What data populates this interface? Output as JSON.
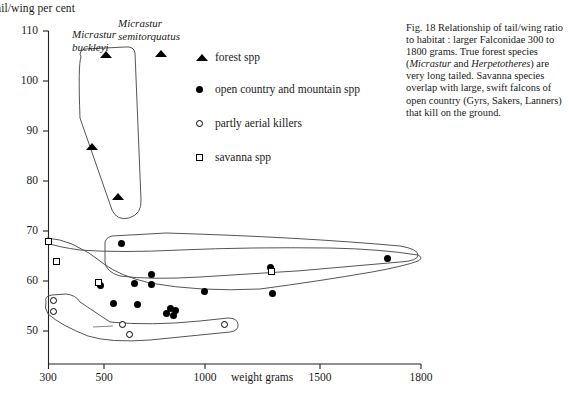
{
  "figure": {
    "caption_label": "Fig. 18",
    "caption_parts": [
      {
        "text": "Fig. 18 Relationship of tail/wing ratio to habitat : larger Falconidae 300 to 1800 grams. True forest species (",
        "style": "roman"
      },
      {
        "text": "Micrastur",
        "style": "italic"
      },
      {
        "text": " and ",
        "style": "roman"
      },
      {
        "text": "Herpetotheres",
        "style": "italic"
      },
      {
        "text": ") are very long tailed. Savanna species overlap with large, swift falcons of open country (Gyrs, Sakers, Lanners) that kill on the ground.",
        "style": "roman"
      }
    ]
  },
  "chart_data": {
    "type": "scatter",
    "title": "",
    "xlabel": "weight grams",
    "ylabel": "ail/wing per cent",
    "ylabel_full": "tail/wing per cent",
    "ylim": [
      46,
      110
    ],
    "yticks": [
      110,
      100,
      90,
      80,
      70,
      60,
      50
    ],
    "xticks": [
      300,
      500,
      1000,
      1500,
      1800
    ],
    "x_scale_note": "non-linear spacing: 300 and 500 compressed left, 500-1800 expanded",
    "grid": false,
    "legend_position": "upper-right-inside",
    "series": [
      {
        "name": "forest spp",
        "marker": "filled-triangle",
        "color": "#000000",
        "points": [
          {
            "x": 500,
            "y": 105.2
          },
          {
            "x": 660,
            "y": 105.4
          },
          {
            "x": 490,
            "y": 86.5
          },
          {
            "x": 560,
            "y": 76.5
          }
        ]
      },
      {
        "name": "open country and mountain spp",
        "marker": "filled-circle",
        "color": "#000000",
        "points": [
          {
            "x": 640,
            "y": 65.6
          },
          {
            "x": 575,
            "y": 57.2
          },
          {
            "x": 700,
            "y": 57.6
          },
          {
            "x": 760,
            "y": 59.3
          },
          {
            "x": 760,
            "y": 57.3
          },
          {
            "x": 625,
            "y": 53.7
          },
          {
            "x": 720,
            "y": 53.4
          },
          {
            "x": 800,
            "y": 51.8
          },
          {
            "x": 812,
            "y": 52.6
          },
          {
            "x": 820,
            "y": 51.2
          },
          {
            "x": 830,
            "y": 52.1
          },
          {
            "x": 950,
            "y": 56.4
          },
          {
            "x": 1240,
            "y": 61.2
          },
          {
            "x": 1250,
            "y": 56.0
          },
          {
            "x": 1745,
            "y": 63.0
          }
        ]
      },
      {
        "name": "partly aerial killers",
        "marker": "open-circle",
        "color": "#000000",
        "points": [
          {
            "x": 335,
            "y": 54.4
          },
          {
            "x": 338,
            "y": 52.2
          },
          {
            "x": 755,
            "y": 49.6
          },
          {
            "x": 790,
            "y": 47.5
          },
          {
            "x": 1010,
            "y": 49.3
          }
        ]
      },
      {
        "name": "savanna spp",
        "marker": "open-square",
        "color": "#000000",
        "points": [
          {
            "x": 305,
            "y": 66.4
          },
          {
            "x": 345,
            "y": 62.5
          },
          {
            "x": 605,
            "y": 58.1
          },
          {
            "x": 1240,
            "y": 60.4
          }
        ]
      }
    ],
    "annotations": [
      {
        "text": "Micrastur buckleyi",
        "style": "italic",
        "x": 500,
        "y": 108
      },
      {
        "text": "Micrastur semitorquatus",
        "style": "italic",
        "x": 690,
        "y": 109.5
      }
    ],
    "envelopes": [
      {
        "name": "forest-spp-envelope",
        "encloses": "forest spp"
      },
      {
        "name": "open-country-envelope",
        "encloses": "open country and mountain spp"
      },
      {
        "name": "savanna-envelope",
        "encloses": "savanna spp"
      },
      {
        "name": "aerial-killers-envelope",
        "encloses": "partly aerial killers"
      }
    ]
  },
  "legend": {
    "items": [
      {
        "label": "forest spp",
        "marker": "filled-triangle"
      },
      {
        "label": "open country and mountain spp",
        "marker": "filled-circle"
      },
      {
        "label": "partly aerial killers",
        "marker": "open-circle"
      },
      {
        "label": "savanna spp",
        "marker": "open-square"
      }
    ]
  },
  "axis": {
    "y_ticks": [
      "110",
      "100",
      "90",
      "80",
      "70",
      "60",
      "50"
    ],
    "x_ticks": [
      "300",
      "500",
      "1000",
      "1500",
      "1800"
    ],
    "x_title": "weight grams",
    "y_title": "ail/wing per cent"
  }
}
